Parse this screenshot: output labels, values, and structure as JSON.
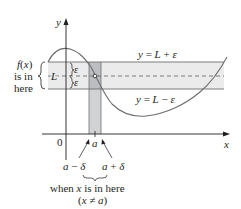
{
  "diagram": {
    "axes": {
      "x_label": "x",
      "y_label": "y",
      "origin_label": "0"
    },
    "horizontal_band": {
      "upper_line_label": "y = L + ε",
      "lower_line_label": "y = L − ε",
      "center_label": "L",
      "upper_epsilon": "ε",
      "lower_epsilon": "ε",
      "fill_color": "#ebebeb",
      "line_color": "#6d6e71"
    },
    "vertical_band": {
      "center_label": "a",
      "left_label": "a − δ",
      "right_label": "a + δ",
      "fill_color": "#d1d2d4"
    },
    "annotations": {
      "fx_line1": "f(x)",
      "fx_line2": "is in",
      "fx_line3": "here",
      "x_line1": "when x is in here",
      "x_line2": "(x ≠ a)"
    },
    "curve": {
      "stroke_color": "#6d6e71",
      "description": "curve rises to a peak near the y-axis, descends through the bands at x=a with a hole at (a, L), dips to a minimum below the band, and rises back up through the band on the right"
    },
    "colors": {
      "axis": "#231f20",
      "text": "#231f20",
      "background": "#ffffff"
    }
  }
}
